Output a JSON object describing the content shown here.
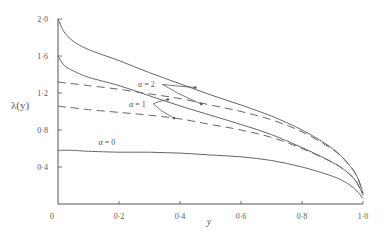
{
  "chart_data": {
    "type": "line",
    "title": "",
    "xlabel": "y",
    "ylabel": "λ(y)",
    "xlim": [
      0,
      1.0
    ],
    "ylim": [
      0,
      2.0
    ],
    "grid": false,
    "legend": "inline annotations",
    "x_ticks": [
      0,
      0.2,
      0.4,
      0.6,
      0.8,
      1.0
    ],
    "x_tick_labels": [
      "0",
      "0·2",
      "0·4",
      "0·6",
      "0·8",
      "1·0"
    ],
    "y_ticks": [
      0.4,
      0.8,
      1.2,
      1.6,
      2.0
    ],
    "y_tick_labels": [
      "0·4",
      "0·8",
      "1·2",
      "1·6",
      "2·0"
    ],
    "x": [
      0,
      0.02,
      0.05,
      0.1,
      0.2,
      0.3,
      0.4,
      0.5,
      0.6,
      0.7,
      0.8,
      0.9,
      0.95,
      0.98,
      1.0
    ],
    "series": [
      {
        "name": "α = 2 (solid)",
        "style": "solid",
        "values": [
          2.0,
          1.86,
          1.76,
          1.67,
          1.55,
          1.42,
          1.3,
          1.18,
          1.07,
          0.95,
          0.8,
          0.6,
          0.44,
          0.3,
          0.12
        ]
      },
      {
        "name": "α = 2 (dashed)",
        "style": "dashed",
        "values": [
          1.32,
          1.31,
          1.3,
          1.28,
          1.24,
          1.19,
          1.14,
          1.07,
          1.0,
          0.91,
          0.78,
          0.59,
          0.44,
          0.3,
          0.12
        ]
      },
      {
        "name": "α = 1 (solid)",
        "style": "solid",
        "values": [
          1.6,
          1.5,
          1.44,
          1.37,
          1.28,
          1.17,
          1.06,
          0.96,
          0.86,
          0.75,
          0.61,
          0.45,
          0.34,
          0.23,
          0.1
        ]
      },
      {
        "name": "α = 1 (dashed)",
        "style": "dashed",
        "values": [
          1.06,
          1.05,
          1.04,
          1.02,
          0.99,
          0.96,
          0.92,
          0.86,
          0.8,
          0.72,
          0.6,
          0.45,
          0.34,
          0.23,
          0.1
        ]
      },
      {
        "name": "α = 0",
        "style": "solid",
        "values": [
          0.58,
          0.58,
          0.58,
          0.57,
          0.56,
          0.56,
          0.55,
          0.53,
          0.51,
          0.47,
          0.4,
          0.3,
          0.22,
          0.14,
          0.06
        ]
      }
    ],
    "annotations": [
      {
        "text": "α = 2",
        "x": 0.29,
        "y": 1.26,
        "arrows_to": [
          [
            0.45,
            1.26
          ],
          [
            0.47,
            1.08
          ]
        ]
      },
      {
        "text": "α = 1",
        "x": 0.26,
        "y": 1.05,
        "arrows_to": [
          [
            0.36,
            1.13
          ],
          [
            0.38,
            0.93
          ]
        ]
      },
      {
        "text": "α = 0",
        "x": 0.16,
        "y": 0.64,
        "arrows_to": []
      }
    ]
  }
}
